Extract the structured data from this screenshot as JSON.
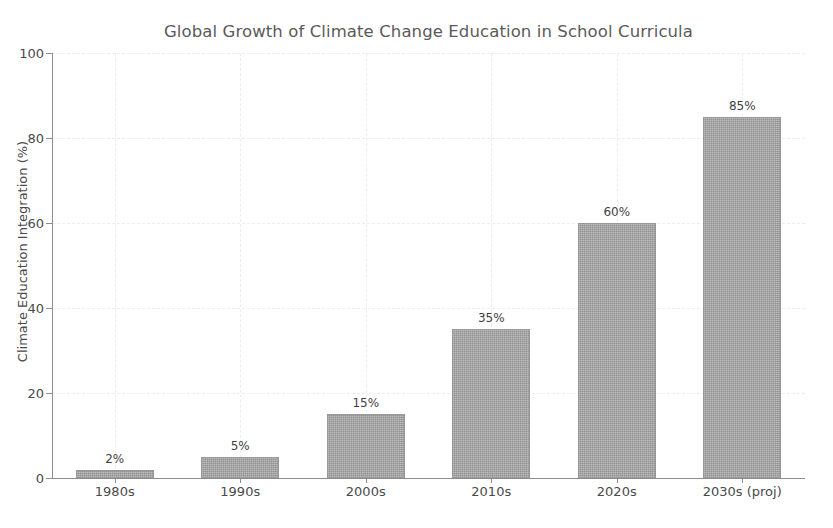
{
  "chart_data": {
    "type": "bar",
    "title": "Global Growth of Climate Change Education in School Curricula",
    "xlabel": "",
    "ylabel": "Climate Education Integration (%)",
    "categories": [
      "1980s",
      "1990s",
      "2000s",
      "2010s",
      "2020s",
      "2030s (proj)"
    ],
    "values": [
      2,
      5,
      15,
      35,
      60,
      85
    ],
    "value_labels": [
      "2%",
      "5%",
      "15%",
      "35%",
      "60%",
      "85%"
    ],
    "ylim": [
      0,
      100
    ],
    "y_ticks": [
      0,
      20,
      40,
      60,
      80,
      100
    ],
    "y_tick_labels": [
      "0",
      "20",
      "40",
      "60",
      "80",
      "100"
    ],
    "grid": true,
    "grid_axis": "both",
    "legend": null,
    "legend_position": "none",
    "bar_color": "#9f9f9f",
    "text_color": "#4a4a4a",
    "title_color": "#5a5a5a",
    "grid_color": "#ededed",
    "axis_color": "#8e8e8e",
    "background_color": "#ffffff"
  }
}
